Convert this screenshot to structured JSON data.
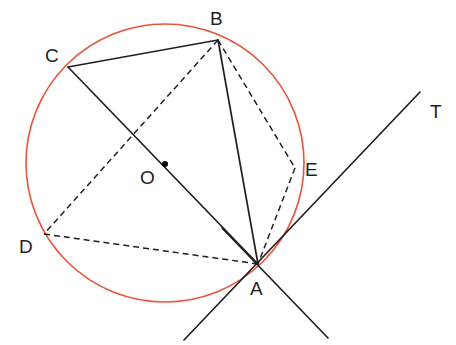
{
  "figure": {
    "type": "circle-geometry-diagram",
    "canvas": {
      "width": 456,
      "height": 345,
      "background": "#ffffff"
    }
  },
  "colors": {
    "circle_stroke": "#e8553c",
    "line_stroke": "#231f20",
    "label_fill": "#231f20",
    "center_dot": "#000000"
  },
  "circle": {
    "name": "circumscribed-circle",
    "cx": 165,
    "cy": 163,
    "r": 139,
    "stroke_width": 1.6
  },
  "center": {
    "label": "O",
    "dot_x": 165,
    "dot_y": 164,
    "dot_r": 3.0,
    "label_x": 140,
    "label_y": 184
  },
  "points": [
    {
      "id": "B",
      "label": "B",
      "x": 218,
      "y": 40,
      "label_x": 210,
      "label_y": 25,
      "on_circle": true
    },
    {
      "id": "C",
      "label": "C",
      "x": 68,
      "y": 67,
      "label_x": 45,
      "label_y": 62,
      "on_circle": true
    },
    {
      "id": "D",
      "label": "D",
      "x": 44,
      "y": 234,
      "label_x": 19,
      "label_y": 253,
      "on_circle": true
    },
    {
      "id": "E",
      "label": "E",
      "x": 295,
      "y": 168,
      "label_x": 305,
      "label_y": 176,
      "on_circle": true
    },
    {
      "id": "A",
      "label": "A",
      "x": 258,
      "y": 264,
      "label_x": 250,
      "label_y": 295,
      "on_circle": true
    },
    {
      "id": "T",
      "label": "T",
      "x": 420,
      "y": 92,
      "label_x": 430,
      "label_y": 118,
      "on_circle": false
    }
  ],
  "segments": [
    {
      "id": "CB",
      "from": "C",
      "to": "B",
      "style": "solid",
      "x1": 68,
      "y1": 67,
      "x2": 218,
      "y2": 40
    },
    {
      "id": "CA",
      "from": "C",
      "to": "A",
      "style": "solid",
      "x1": 68,
      "y1": 67,
      "x2": 258,
      "y2": 264
    },
    {
      "id": "BA",
      "from": "B",
      "to": "A",
      "style": "solid",
      "x1": 218,
      "y1": 40,
      "x2": 258,
      "y2": 264
    },
    {
      "id": "BD",
      "from": "B",
      "to": "D",
      "style": "dashed",
      "x1": 218,
      "y1": 40,
      "x2": 44,
      "y2": 234
    },
    {
      "id": "BE",
      "from": "B",
      "to": "E",
      "style": "dashed",
      "x1": 218,
      "y1": 40,
      "x2": 295,
      "y2": 168
    },
    {
      "id": "EA",
      "from": "E",
      "to": "A",
      "style": "dashed",
      "x1": 295,
      "y1": 168,
      "x2": 258,
      "y2": 264
    },
    {
      "id": "DA",
      "from": "D",
      "to": "A",
      "style": "dashed",
      "x1": 44,
      "y1": 234,
      "x2": 258,
      "y2": 264
    }
  ],
  "lines": [
    {
      "id": "tangent-AT",
      "description": "tangent line through A toward T",
      "style": "solid",
      "x1": 184,
      "y1": 340,
      "x2": 420,
      "y2": 92
    },
    {
      "id": "secant-through-A",
      "description": "line through A extending down-right",
      "style": "solid",
      "x1": 222,
      "y1": 228,
      "x2": 328,
      "y2": 338
    }
  ],
  "stroke_widths": {
    "solid": 1.7,
    "dashed": 1.5
  },
  "dash_pattern": "6,4"
}
